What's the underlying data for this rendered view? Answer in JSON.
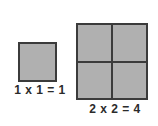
{
  "figure": {
    "background_color": "#ffffff",
    "fill_color": "#b0b0b0",
    "border_color": "#3b3b3b",
    "text_color": "#2b2b2b"
  },
  "chart_data": {
    "type": "table",
    "xlabel": "",
    "ylabel": "",
    "categories": [
      "1 x 1",
      "2 x 2"
    ],
    "values": [
      1,
      4
    ],
    "series": [
      {
        "name": "unit squares",
        "values": [
          1,
          4
        ]
      }
    ],
    "annotations": [
      "1 x 1 = 1",
      "2 x 2 = 4"
    ]
  },
  "figures": [
    {
      "id": "square-1x1",
      "rows": 1,
      "columns": 1,
      "cell_count": 1,
      "label": "1 x 1 = 1",
      "factor_a": "1",
      "factor_b": "1",
      "product": "1"
    },
    {
      "id": "square-2x2",
      "rows": 2,
      "columns": 2,
      "cell_count": 4,
      "label": "2 x 2 = 4",
      "factor_a": "2",
      "factor_b": "2",
      "product": "4"
    }
  ]
}
